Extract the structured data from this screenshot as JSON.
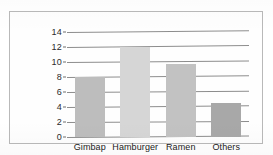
{
  "chart_data": {
    "type": "bar",
    "title": "",
    "subtitle": "",
    "xlabel": "",
    "ylabel": "",
    "categories": [
      "Gimbap",
      "Hamburger",
      "Ramen",
      "Others"
    ],
    "values": [
      8,
      12,
      9.8,
      4.5
    ],
    "series": [
      {
        "name": "",
        "values": [
          8,
          12,
          9.8,
          4.5
        ]
      }
    ],
    "ylim": [
      0,
      14
    ],
    "yticks": [
      0,
      2,
      4,
      6,
      8,
      10,
      12,
      14
    ],
    "ytick_labels": [
      "0",
      "2",
      "4",
      "6",
      "8",
      "10",
      "12",
      "14"
    ],
    "grid": true,
    "grid_axis": "y",
    "legend": false,
    "legend_position": "none",
    "bar_colors": [
      "#bdbdbd",
      "#d6d6d6",
      "#c2c2c2",
      "#a8a8a8"
    ],
    "grid_color": "#8d8d8d",
    "frame_color": "#b9b9b9",
    "background_color": "#ffffff",
    "annotations": []
  }
}
